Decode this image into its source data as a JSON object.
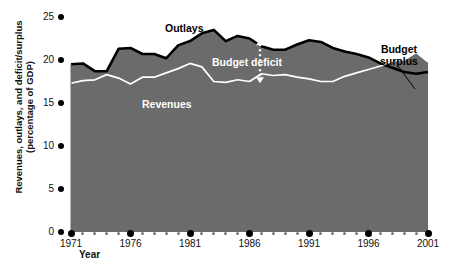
{
  "chart_data": {
    "type": "area",
    "title": "",
    "xlabel": "Year",
    "ylabel": "Revenues, outlays, and deficit/surplus (percentage of GDP)",
    "xlim": [
      1971,
      2001
    ],
    "ylim": [
      0,
      25
    ],
    "grid": false,
    "legend_position": "inline-annotations",
    "x": [
      1971,
      1972,
      1973,
      1974,
      1975,
      1976,
      1977,
      1978,
      1979,
      1980,
      1981,
      1982,
      1983,
      1984,
      1985,
      1986,
      1987,
      1988,
      1989,
      1990,
      1991,
      1992,
      1993,
      1994,
      1995,
      1996,
      1997,
      1998,
      1999,
      2000,
      2001
    ],
    "series": [
      {
        "name": "Outlays",
        "values": [
          19.5,
          19.6,
          18.7,
          18.7,
          21.3,
          21.4,
          20.7,
          20.7,
          20.2,
          21.7,
          22.2,
          23.1,
          23.5,
          22.2,
          22.8,
          22.5,
          21.6,
          21.2,
          21.2,
          21.8,
          22.3,
          22.1,
          21.4,
          21.0,
          20.7,
          20.3,
          19.6,
          19.1,
          18.6,
          18.4,
          18.6
        ],
        "color": "#000000",
        "role": "upper-boundary"
      },
      {
        "name": "Revenues",
        "values": [
          17.3,
          17.6,
          17.7,
          18.3,
          17.9,
          17.2,
          18.0,
          18.0,
          18.5,
          19.0,
          19.6,
          19.2,
          17.5,
          17.4,
          17.7,
          17.5,
          18.4,
          18.2,
          18.3,
          18.0,
          17.8,
          17.5,
          17.5,
          18.1,
          18.5,
          18.9,
          19.3,
          19.9,
          20.0,
          20.9,
          19.8
        ],
        "color": "#ffffff",
        "role": "lower-boundary"
      }
    ],
    "fill_color": "#6b6b6b",
    "annotations": [
      {
        "name": "outlays",
        "text": "Outlays"
      },
      {
        "name": "revenues",
        "text": "Revenues"
      },
      {
        "name": "budget-deficit",
        "text": "Budget deficit"
      },
      {
        "name": "budget-surplus",
        "text": "Budget\nsurplus"
      }
    ],
    "yticks": [
      "0",
      "5",
      "10",
      "15",
      "20",
      "25"
    ],
    "xticks": [
      "1971",
      "1976",
      "1981",
      "1986",
      "1991",
      "1996",
      "2001"
    ]
  },
  "axes": {
    "y": {
      "title_line1": "Revenues, outlays, and deficit/surplus",
      "title_line2": "(percentage of GDP)",
      "ticks": [
        {
          "label": "25"
        },
        {
          "label": "20"
        },
        {
          "label": "15"
        },
        {
          "label": "10"
        },
        {
          "label": "5"
        },
        {
          "label": "0"
        }
      ]
    },
    "x": {
      "title": "Year",
      "ticks": [
        {
          "label": "1971"
        },
        {
          "label": "1976"
        },
        {
          "label": "1981"
        },
        {
          "label": "1986"
        },
        {
          "label": "1991"
        },
        {
          "label": "1996"
        },
        {
          "label": "2001"
        }
      ]
    }
  },
  "annotations": {
    "outlays": "Outlays",
    "revenues": "Revenues",
    "budget_deficit": "Budget deficit",
    "budget_surplus_line1": "Budget",
    "budget_surplus_line2": "surplus"
  },
  "colors": {
    "area_fill": "#6b6b6b",
    "outlays_line": "#000000",
    "revenues_line": "#ffffff",
    "background": "#ffffff",
    "text": "#111111"
  }
}
